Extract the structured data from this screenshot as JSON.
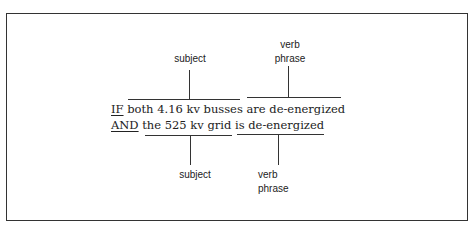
{
  "diagram": {
    "top_labels": {
      "subject": "subject",
      "verb_phrase_line1": "verb",
      "verb_phrase_line2": "phrase"
    },
    "sentence": {
      "line1": {
        "keyword": "IF",
        "rest": " both 4.16 kv busses are de-energized"
      },
      "line2": {
        "keyword": "AND",
        "rest": " the 525 kv grid is de-energized"
      }
    },
    "bottom_labels": {
      "subject": "subject",
      "verb_phrase_line1": "verb",
      "verb_phrase_line2": "phrase"
    }
  }
}
